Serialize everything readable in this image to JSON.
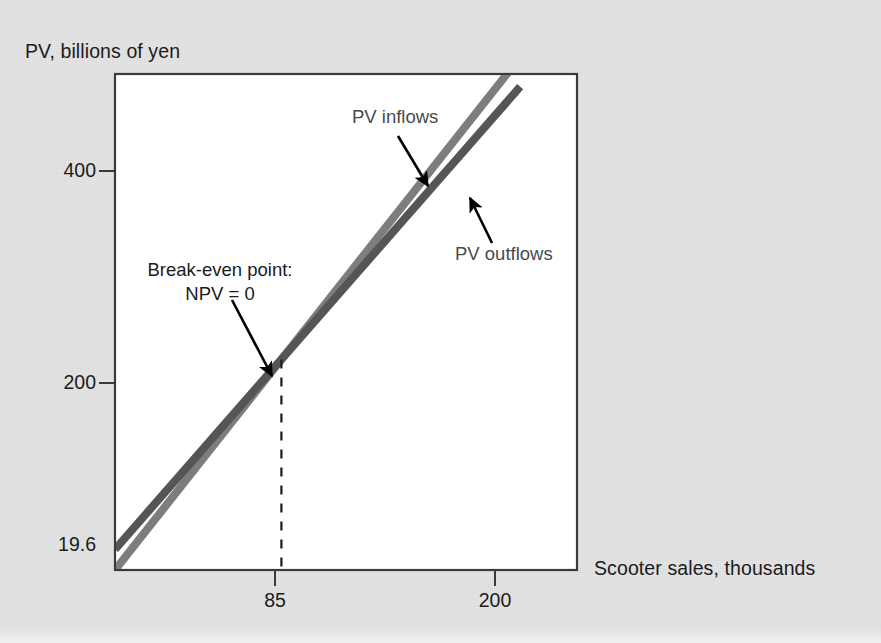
{
  "chart_data": {
    "type": "line",
    "title": "",
    "xlabel": "Scooter sales, thousands",
    "ylabel": "PV, billions of yen",
    "xlim": [
      0,
      236
    ],
    "ylim": [
      0,
      471
    ],
    "grid": false,
    "legend_position": "inline-annotations",
    "xticks": [
      {
        "value": 85,
        "label": "85"
      },
      {
        "value": 200,
        "label": "200"
      }
    ],
    "yticks": [
      {
        "value": 200,
        "label": "200"
      },
      {
        "value": 400,
        "label": "400"
      }
    ],
    "y_axis_notes": [
      {
        "value": 19.6,
        "label": "19.6",
        "tick": false,
        "note": "PV outflows intercept"
      }
    ],
    "series": [
      {
        "name": "PV inflows",
        "color": "#7d7d7d",
        "intercept": 0,
        "slope": 2.353,
        "points": [
          {
            "x": 0,
            "y": 0
          },
          {
            "x": 85,
            "y": 200
          },
          {
            "x": 207,
            "y": 487
          }
        ]
      },
      {
        "name": "PV outflows",
        "color": "#555555",
        "intercept": 19.6,
        "slope": 2.122,
        "points": [
          {
            "x": 0,
            "y": 19.6
          },
          {
            "x": 85,
            "y": 200
          },
          {
            "x": 207,
            "y": 459
          }
        ]
      }
    ],
    "annotations": [
      {
        "name": "break-even",
        "text_lines": [
          "Break-even point:",
          "NPV = 0"
        ],
        "target": {
          "x": 85,
          "y": 200
        }
      },
      {
        "name": "pv-inflows-pointer",
        "text": "PV inflows",
        "target_series": "PV inflows"
      },
      {
        "name": "pv-outflows-pointer",
        "text": "PV outflows",
        "target_series": "PV outflows"
      }
    ],
    "dashed_dropline": {
      "x": 85,
      "from_y": 200,
      "to_y": 0
    }
  },
  "labels": {
    "y_axis_title": "PV, billions of yen",
    "x_axis_title": "Scooter sales, thousands",
    "ytick_400": "400",
    "ytick_200": "200",
    "yvalue_196": "19.6",
    "xtick_85": "85",
    "xtick_200": "200",
    "series_inflows": "PV inflows",
    "series_outflows": "PV outflows",
    "breakeven_line1": "Break-even point:",
    "breakeven_line2": "NPV = 0"
  },
  "colors": {
    "background": "#e4e4e4",
    "plot_background": "#ffffff",
    "axis": "#3a3a3a",
    "inflows_line": "#7d7d7d",
    "outflows_line": "#555555",
    "text": "#1b1b1b",
    "series_label_text": "#4a4a4a",
    "dashed_line": "#1b1b1b"
  },
  "icons": {
    "breakeven_arrow": "arrow-down-right-icon",
    "inflows_arrow": "arrow-down-right-icon",
    "outflows_arrow": "arrow-up-left-icon"
  }
}
